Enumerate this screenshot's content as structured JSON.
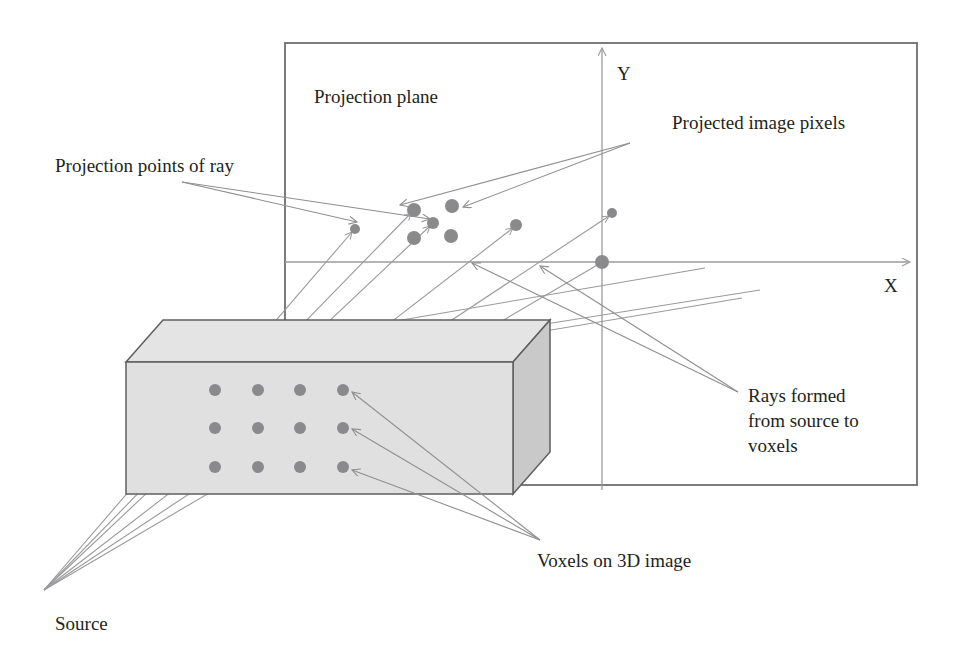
{
  "figure": {
    "kind": "technical-diagram",
    "width": 962,
    "height": 665,
    "background_color": "#ffffff"
  },
  "colors": {
    "outline": "#6e6e70",
    "plane_border": "#6d6e70",
    "box_front_fill": "#e0e0e0",
    "box_top_fill": "#e5e5e5",
    "box_side_fill": "#c9c9c9",
    "box_edge": "#5f5f61",
    "dot_fill": "#8a8a8c",
    "ray_line": "#9a9a9c",
    "arrow_line": "#8f8f91",
    "axis_line": "#9b9b9d",
    "text": "#231f20"
  },
  "labels": {
    "projection_plane": "Projection plane",
    "projected_image_pixels": "Projected image pixels",
    "projection_points_of_ray": "Projection points of ray",
    "rays_formed_line1": "Rays formed",
    "rays_formed_line2": "from source to",
    "rays_formed_line3": "voxels",
    "voxels_on_3d_image": "Voxels on 3D image",
    "source": "Source",
    "axis_x": "X",
    "axis_y": "Y"
  },
  "projection_plane": {
    "x": 285,
    "y": 43,
    "width": 632,
    "height": 442,
    "origin": {
      "x": 602,
      "y": 262
    }
  },
  "axes": {
    "x_axis": {
      "x1": 285,
      "y1": 262,
      "x2": 912,
      "y2": 262
    },
    "y_axis": {
      "x1": 602,
      "y1": 490,
      "x2": 602,
      "y2": 46
    },
    "x_label_pos": {
      "x": 884,
      "y": 292
    },
    "y_label_pos": {
      "x": 617,
      "y": 80
    }
  },
  "volume_box": {
    "front_face": {
      "x": 126,
      "y": 362,
      "width": 387,
      "height": 132
    },
    "depth_dx": 37,
    "depth_dy": -42
  },
  "voxels": {
    "columns_x": [
      215,
      258,
      300,
      343
    ],
    "rows_y": [
      390,
      428,
      467
    ],
    "radius": 6,
    "count": 12
  },
  "source_point": {
    "x": 44,
    "y": 590
  },
  "projection_points": [
    {
      "id": "p1",
      "x": 355,
      "y": 229,
      "r": 5
    },
    {
      "id": "p2",
      "x": 414,
      "y": 210,
      "r": 7
    },
    {
      "id": "p3",
      "x": 452,
      "y": 206,
      "r": 7
    },
    {
      "id": "p4",
      "x": 414,
      "y": 238,
      "r": 7
    },
    {
      "id": "p5",
      "x": 451,
      "y": 236,
      "r": 7
    },
    {
      "id": "p6",
      "x": 433,
      "y": 223,
      "r": 6
    },
    {
      "id": "p7",
      "x": 516,
      "y": 225,
      "r": 6
    },
    {
      "id": "p8",
      "x": 612,
      "y": 213,
      "r": 5
    },
    {
      "id": "p9",
      "x": 602,
      "y": 262,
      "r": 7
    }
  ],
  "text_positions": {
    "projection_plane": {
      "x": 314,
      "y": 103
    },
    "projected_image_pixels": {
      "x": 672,
      "y": 129
    },
    "projection_points_of_ray": {
      "x": 55,
      "y": 172
    },
    "rays_formed": {
      "x": 748,
      "y": 402
    },
    "voxels_on_3d_image": {
      "x": 537,
      "y": 567
    },
    "source": {
      "x": 55,
      "y": 630
    }
  }
}
